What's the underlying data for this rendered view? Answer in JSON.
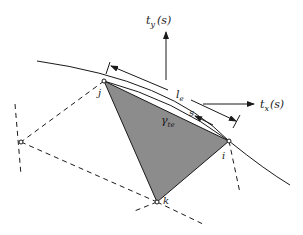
{
  "diagram": {
    "colors": {
      "line": "#1a1a1a",
      "triangle_fill": "#8c8c8c",
      "background": "#ffffff"
    },
    "nodes": {
      "i": {
        "label": "i",
        "x": 229,
        "y": 141
      },
      "j": {
        "label": "j",
        "x": 104,
        "y": 81
      },
      "k": {
        "label": "k",
        "x": 157,
        "y": 202
      },
      "left": {
        "label": "",
        "x": 21,
        "y": 142
      }
    },
    "labels": {
      "ty": "t",
      "ty_sub": "y",
      "ty_arg": "(s)",
      "tx": "t",
      "tx_sub": "x",
      "tx_arg": "(s)",
      "le": "l",
      "le_sub": "e",
      "s": "s",
      "gamma": "γ",
      "gamma_sub": "te"
    }
  }
}
